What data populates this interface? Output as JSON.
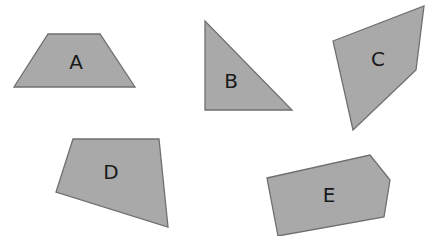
{
  "diagram": {
    "shapes": [
      {
        "label": "A",
        "type": "trapezoid",
        "points": "48,34 100,34 135,87 14,87",
        "label_pos": [
          76,
          63
        ]
      },
      {
        "label": "B",
        "type": "right-triangle",
        "points": "205,21 205,110 292,110",
        "label_pos": [
          231,
          82
        ]
      },
      {
        "label": "C",
        "type": "quadrilateral",
        "points": "333,41 424,6 416,70 353,130",
        "label_pos": [
          378,
          60
        ]
      },
      {
        "label": "D",
        "type": "quadrilateral",
        "points": "73,139 159,139 168,227 56,192",
        "label_pos": [
          111,
          173
        ]
      },
      {
        "label": "E",
        "type": "pentagon",
        "points": "267,178 370,155 390,180 384,217 278,236",
        "label_pos": [
          329,
          196
        ]
      }
    ],
    "colors": {
      "fill": "#a9a9a9",
      "stroke": "#6f6f6f",
      "label": "#1a1a1a",
      "background": "#ffffff"
    }
  }
}
